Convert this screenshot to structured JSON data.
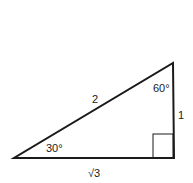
{
  "diagram": {
    "type": "right-triangle",
    "vertices": {
      "bottom_left": [
        14,
        158
      ],
      "bottom_right": [
        174,
        158
      ],
      "top": [
        173,
        63
      ]
    },
    "sides": {
      "hypotenuse": "2",
      "vertical_leg": "1",
      "base": "√3"
    },
    "angles": {
      "bottom_left": "30°",
      "top": "60°",
      "right_angle_marker": true
    },
    "colors": {
      "stroke": "#1a1a1a",
      "background": "#ffffff"
    }
  }
}
